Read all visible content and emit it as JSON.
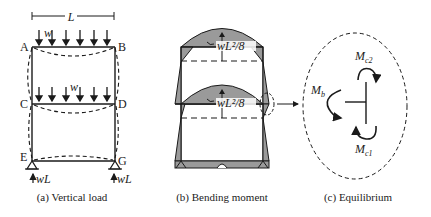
{
  "panels": {
    "a": {
      "caption": "(a) Vertical load",
      "span_label": "L",
      "load_label_top": "w",
      "load_label_mid": "w",
      "nodes": {
        "A": "A",
        "B": "B",
        "C": "C",
        "D": "D",
        "E": "E",
        "G": "G"
      },
      "reaction_left": "wL",
      "reaction_right": "wL"
    },
    "b": {
      "caption": "(b) Bending moment",
      "moment_label_top": "wL²/8",
      "moment_label_mid": "wL²/8"
    },
    "c": {
      "caption": "(c) Equilibrium",
      "moment_b": "M",
      "moment_b_sub": "b",
      "moment_c2": "M",
      "moment_c2_sub": "c2",
      "moment_c1": "M",
      "moment_c1_sub": "c1"
    }
  },
  "colors": {
    "line": "#1a1a1a",
    "fill": "#9a9a9a"
  }
}
